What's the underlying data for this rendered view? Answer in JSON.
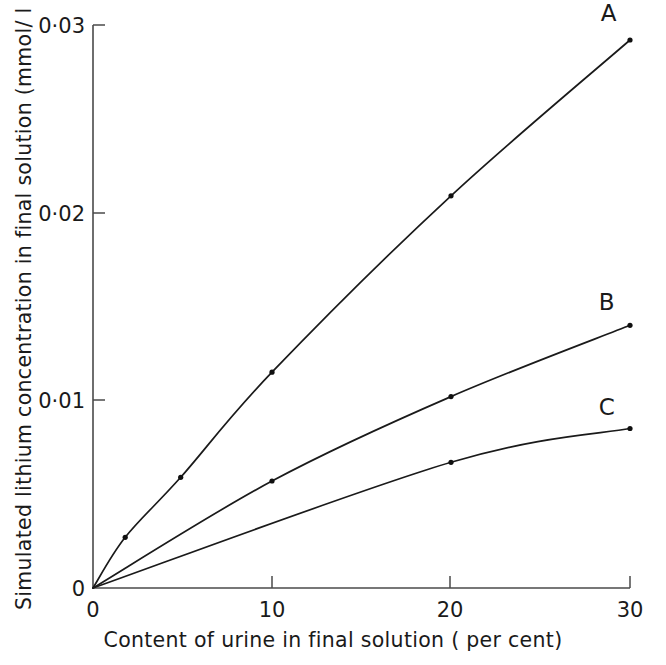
{
  "chart_data": {
    "type": "line",
    "title": "",
    "xlabel": "Content of urine in final solution  ( per cent)",
    "ylabel": "Simulated lithium concentration in final solution (mmol/ l )",
    "xlim": [
      0,
      30
    ],
    "ylim": [
      0,
      0.03
    ],
    "xticks": [
      0,
      10,
      20,
      30
    ],
    "xticklabels": [
      "0",
      "10",
      "20",
      "30"
    ],
    "yticks": [
      0,
      0.01,
      0.02,
      0.03
    ],
    "yticklabels": [
      "0",
      "0·01",
      "0·02",
      "0·03"
    ],
    "grid": false,
    "legend_position": "inline-end-of-curve",
    "series": [
      {
        "name": "A",
        "label": "A",
        "marker": "dot",
        "x": [
          0,
          1.8,
          4.9,
          10,
          20,
          30
        ],
        "y": [
          0,
          0.0027,
          0.0059,
          0.0115,
          0.0209,
          0.0292
        ]
      },
      {
        "name": "B",
        "label": "B",
        "marker": "dot",
        "x": [
          0,
          10,
          20,
          30
        ],
        "y": [
          0,
          0.0057,
          0.0102,
          0.014
        ]
      },
      {
        "name": "C",
        "label": "C",
        "marker": "dot",
        "x": [
          0,
          20,
          30
        ],
        "y": [
          0,
          0.0067,
          0.0085
        ]
      }
    ],
    "annotations": [
      {
        "text": "A",
        "x": 28.8,
        "y": 0.0302
      },
      {
        "text": "B",
        "x": 28.7,
        "y": 0.0148
      },
      {
        "text": "C",
        "x": 28.7,
        "y": 0.0092
      }
    ]
  }
}
